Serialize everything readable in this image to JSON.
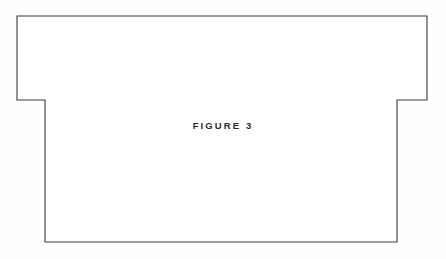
{
  "figure": {
    "caption": "FIGURE 3",
    "caption_label": "FIGURE",
    "caption_number": "3",
    "sheet": {
      "width": 446,
      "height": 259,
      "background_color": "#fefefe"
    },
    "outline": {
      "name": "stepped-rectangle-outline",
      "shape_type": "polygon",
      "stroke_color": "#3a3a3a",
      "fill_color": "#ffffff",
      "stroke_width": 1.1,
      "vertices": [
        [
          17,
          16
        ],
        [
          427,
          16
        ],
        [
          427,
          100
        ],
        [
          397,
          100
        ],
        [
          397,
          242
        ],
        [
          45,
          242
        ],
        [
          45,
          100
        ],
        [
          17,
          100
        ]
      ],
      "path": "M 17 16 L 427 16 L 427 100 L 397 100 L 397 242 L 45 242 L 45 100 L 17 100 Z"
    },
    "caption_position": {
      "center_x": 219,
      "baseline_y": 130
    }
  }
}
